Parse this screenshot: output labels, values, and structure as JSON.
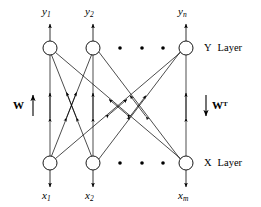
{
  "figure": {
    "type": "neural-network-diagram",
    "background_color": "#ffffff",
    "stroke_color": "#000000"
  },
  "layers": {
    "top": {
      "name": "Y Layer",
      "label_letter": "Y",
      "label_word": "Layer",
      "nodes": [
        {
          "label": "y",
          "subscript": "1",
          "cx": 50,
          "cy": 48
        },
        {
          "label": "y",
          "subscript": "2",
          "cx": 93,
          "cy": 48
        },
        {
          "label": "y",
          "subscript": "n",
          "cx": 186,
          "cy": 48
        }
      ],
      "ellipsis_dots": [
        {
          "cx": 120,
          "cy": 48
        },
        {
          "cx": 142,
          "cy": 48
        },
        {
          "cx": 163,
          "cy": 48
        }
      ]
    },
    "bottom": {
      "name": "X Layer",
      "label_letter": "X",
      "label_word": "Layer",
      "nodes": [
        {
          "label": "x",
          "subscript": "1",
          "cx": 50,
          "cy": 163
        },
        {
          "label": "x",
          "subscript": "2",
          "cx": 93,
          "cy": 163
        },
        {
          "label": "x",
          "subscript": "m",
          "cx": 186,
          "cy": 163
        }
      ],
      "ellipsis_dots": [
        {
          "cx": 120,
          "cy": 163
        },
        {
          "cx": 142,
          "cy": 163
        },
        {
          "cx": 163,
          "cy": 163
        }
      ]
    }
  },
  "weights": {
    "forward": {
      "symbol": "W",
      "superscript": "",
      "arrow": "up",
      "side": "left"
    },
    "backward": {
      "symbol": "W",
      "superscript": "T",
      "arrow": "down",
      "side": "right"
    }
  },
  "node_radius": 7,
  "connections_note": "every X node connects to every Y node with a double-headed arrow"
}
